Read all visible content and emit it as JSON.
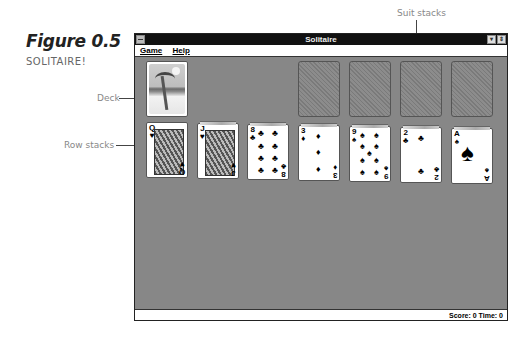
{
  "figure": {
    "title": "Figure 0.5",
    "subtitle": "SOLITAIRE!"
  },
  "callouts": {
    "suit_stacks": "Suit stacks",
    "deck": "Deck",
    "row_stacks": "Row stacks"
  },
  "window": {
    "title": "Solitaire",
    "minimize_glyph": "▾",
    "maximize_glyph": "⇕",
    "menu": [
      {
        "label": "Game"
      },
      {
        "label": "Help"
      }
    ],
    "status": "Score: 0 Time: 0"
  },
  "colors": {
    "felt": "#878787",
    "titlebar": "#111111"
  },
  "deck": {
    "state": "face-down",
    "design": "palm-tree-beach"
  },
  "suit_stacks": [
    {
      "state": "empty"
    },
    {
      "state": "empty"
    },
    {
      "state": "empty"
    },
    {
      "state": "empty"
    }
  ],
  "row_stacks": [
    {
      "rank": "Q",
      "suit": "♥",
      "color": "red",
      "type": "face"
    },
    {
      "rank": "J",
      "suit": "♥",
      "color": "red",
      "type": "face"
    },
    {
      "rank": "8",
      "suit": "♣",
      "color": "black",
      "type": "pips"
    },
    {
      "rank": "3",
      "suit": "♦",
      "color": "red",
      "type": "pips"
    },
    {
      "rank": "9",
      "suit": "♠",
      "color": "black",
      "type": "pips"
    },
    {
      "rank": "2",
      "suit": "♣",
      "color": "black",
      "type": "pips"
    },
    {
      "rank": "A",
      "suit": "♠",
      "color": "black",
      "type": "ace"
    }
  ]
}
